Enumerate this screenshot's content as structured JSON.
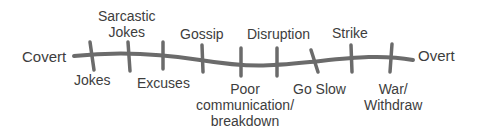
{
  "diagram": {
    "type": "continuum",
    "line_color": "#6b6b6b",
    "text_color": "#3d3d3d",
    "ends": {
      "left": "Covert",
      "right": "Overt"
    },
    "above": [
      {
        "line1": "Sarcastic",
        "line2": "Jokes"
      },
      {
        "line1": "Gossip"
      },
      {
        "line1": "Disruption"
      },
      {
        "line1": "Strike"
      }
    ],
    "below": [
      {
        "line1": "Jokes"
      },
      {
        "line1": "Excuses"
      },
      {
        "line1": "Poor",
        "line2": "communication/",
        "line3": "breakdown"
      },
      {
        "line1": "Go Slow"
      },
      {
        "line1": "War/",
        "line2": "Withdraw"
      }
    ]
  }
}
